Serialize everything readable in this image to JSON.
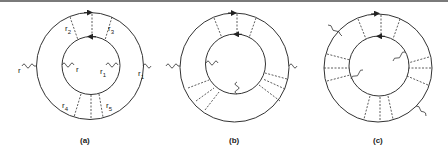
{
  "figure": {
    "panels": [
      {
        "caption": "(a)",
        "labels": {
          "r_outer_left": "r",
          "r_inner_left": "r",
          "r1_inner": "r",
          "r1_inner_sub": "1",
          "r1_outer": "r",
          "r1_outer_sub": "1",
          "r2": "r",
          "r2_sub": "2",
          "r3": "r",
          "r3_sub": "3",
          "r4": "r",
          "r4_sub": "4",
          "r5": "r",
          "r5_sub": "5"
        }
      },
      {
        "caption": "(b)"
      },
      {
        "caption": "(c)"
      }
    ],
    "colors": {
      "line": "#333333",
      "top_rule": "#7a7a7a",
      "background": "#ffffff"
    }
  }
}
